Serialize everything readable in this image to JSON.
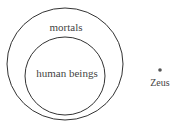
{
  "diagram": {
    "type": "euler-diagram",
    "outer_set": {
      "label": "mortals"
    },
    "inner_set": {
      "label": "human beings"
    },
    "outside_element": {
      "label": "Zeus"
    },
    "colors": {
      "stroke": "#333333",
      "text": "#444444",
      "background": "#ffffff",
      "dot": "#555555"
    }
  }
}
